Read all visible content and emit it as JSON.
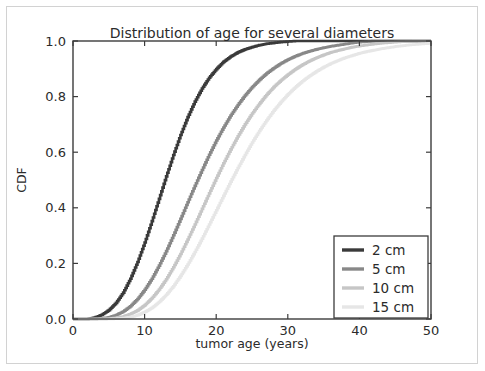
{
  "chart_data": {
    "type": "line",
    "title": "Distribution of age for several diameters",
    "xlabel": "tumor age (years)",
    "ylabel": "CDF",
    "xlim": [
      0,
      50
    ],
    "ylim": [
      0.0,
      1.0
    ],
    "xticks": [
      0,
      10,
      20,
      30,
      40,
      50
    ],
    "xtick_labels": [
      "0",
      "10",
      "20",
      "30",
      "40",
      "50"
    ],
    "yticks": [
      0.0,
      0.2,
      0.4,
      0.6,
      0.8,
      1.0
    ],
    "ytick_labels": [
      "0.0",
      "0.2",
      "0.4",
      "0.6",
      "0.8",
      "1.0"
    ],
    "grid": false,
    "legend_position": "lower right",
    "x": [
      0,
      1,
      2,
      3,
      4,
      5,
      6,
      7,
      8,
      9,
      10,
      11,
      12,
      13,
      14,
      15,
      16,
      17,
      18,
      19,
      20,
      21,
      22,
      23,
      24,
      25,
      26,
      27,
      28,
      29,
      30,
      31,
      32,
      33,
      34,
      35,
      36,
      37,
      38,
      39,
      40,
      41,
      42,
      43,
      44,
      45,
      46,
      47,
      48,
      49,
      50
    ],
    "series": [
      {
        "name": "2 cm",
        "color": "#3a3a3a",
        "values": [
          0.0,
          0.0,
          0.0,
          0.005,
          0.015,
          0.032,
          0.058,
          0.095,
          0.145,
          0.205,
          0.275,
          0.352,
          0.432,
          0.513,
          0.59,
          0.662,
          0.726,
          0.782,
          0.829,
          0.868,
          0.899,
          0.925,
          0.944,
          0.959,
          0.97,
          0.978,
          0.985,
          0.99,
          0.993,
          0.996,
          0.998,
          1.0,
          1.0,
          1.0,
          1.0,
          1.0,
          1.0,
          1.0,
          1.0,
          1.0,
          1.0,
          1.0,
          1.0,
          1.0,
          1.0,
          1.0,
          1.0,
          1.0,
          1.0,
          1.0,
          1.0
        ]
      },
      {
        "name": "5 cm",
        "color": "#888888",
        "values": [
          0.0,
          0.0,
          0.0,
          0.0,
          0.002,
          0.006,
          0.014,
          0.027,
          0.046,
          0.072,
          0.105,
          0.145,
          0.192,
          0.244,
          0.301,
          0.36,
          0.42,
          0.479,
          0.536,
          0.591,
          0.642,
          0.689,
          0.732,
          0.77,
          0.804,
          0.834,
          0.86,
          0.883,
          0.902,
          0.919,
          0.933,
          0.945,
          0.955,
          0.963,
          0.97,
          0.976,
          0.981,
          0.985,
          0.989,
          0.993,
          0.996,
          0.998,
          1.0,
          1.0,
          1.0,
          1.0,
          1.0,
          1.0,
          1.0,
          1.0,
          1.0
        ]
      },
      {
        "name": "10 cm",
        "color": "#c6c6c6",
        "values": [
          0.0,
          0.0,
          0.0,
          0.0,
          0.0,
          0.001,
          0.004,
          0.009,
          0.018,
          0.031,
          0.05,
          0.075,
          0.106,
          0.143,
          0.186,
          0.234,
          0.286,
          0.34,
          0.396,
          0.452,
          0.507,
          0.56,
          0.61,
          0.657,
          0.7,
          0.739,
          0.774,
          0.806,
          0.834,
          0.858,
          0.879,
          0.898,
          0.914,
          0.928,
          0.94,
          0.95,
          0.959,
          0.966,
          0.972,
          0.978,
          0.982,
          0.986,
          0.989,
          0.992,
          0.994,
          0.996,
          0.998,
          0.999,
          1.0,
          1.0,
          1.0
        ]
      },
      {
        "name": "15 cm",
        "color": "#e6e6e6",
        "values": [
          0.0,
          0.0,
          0.0,
          0.0,
          0.0,
          0.0,
          0.001,
          0.003,
          0.007,
          0.014,
          0.025,
          0.04,
          0.061,
          0.087,
          0.118,
          0.155,
          0.196,
          0.241,
          0.289,
          0.34,
          0.391,
          0.443,
          0.494,
          0.543,
          0.59,
          0.635,
          0.676,
          0.714,
          0.749,
          0.78,
          0.808,
          0.833,
          0.855,
          0.874,
          0.891,
          0.906,
          0.919,
          0.93,
          0.94,
          0.948,
          0.956,
          0.962,
          0.967,
          0.972,
          0.976,
          0.98,
          0.983,
          0.986,
          0.988,
          0.99,
          0.992
        ]
      }
    ],
    "legend_entries": [
      {
        "label": "2 cm",
        "color": "#3a3a3a"
      },
      {
        "label": "5 cm",
        "color": "#888888"
      },
      {
        "label": "10 cm",
        "color": "#c6c6c6"
      },
      {
        "label": "15 cm",
        "color": "#e6e6e6"
      }
    ]
  }
}
